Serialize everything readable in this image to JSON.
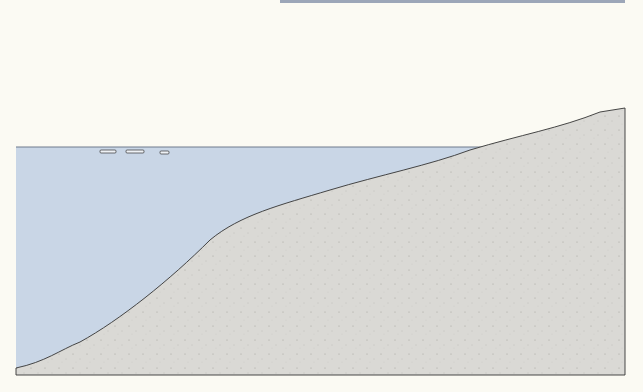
{
  "figure": {
    "caption": "Figure 2.25",
    "colors": {
      "water": "#c9d6e6",
      "sediment": "#d9d8d4",
      "background": "#fbfaf3",
      "caption": "#2c5aa0",
      "ink": "#3a3a44"
    }
  },
  "labels": {
    "export_whole_leaves": [
      "Export of whole",
      "leaves by waterfowl"
    ],
    "dabbler": [
      "Dabbler",
      "Black brant"
    ],
    "export_leaf_material": [
      "Export of leaf",
      "material"
    ],
    "export_animal_tissue": [
      "Export of",
      "animal tissue"
    ],
    "fecal_matter_top": [
      "Fecal",
      "matter"
    ],
    "fecal_matter_fish": [
      "Fecal",
      "matter"
    ],
    "drift_and_export": "Drift and export",
    "decay_sinking": [
      "Decay",
      "sinking"
    ],
    "dissolved_organic_matter": [
      "Dissolved",
      "organic",
      "matter"
    ],
    "production": "Production",
    "litter": "Litter",
    "organic_detritus": "Organic detritus",
    "diving_ducks": [
      "Diving ducks may",
      "have leaves or",
      "epifauna"
    ],
    "detritus_sinking": [
      "Detritus, leaf",
      "material sinking"
    ]
  }
}
